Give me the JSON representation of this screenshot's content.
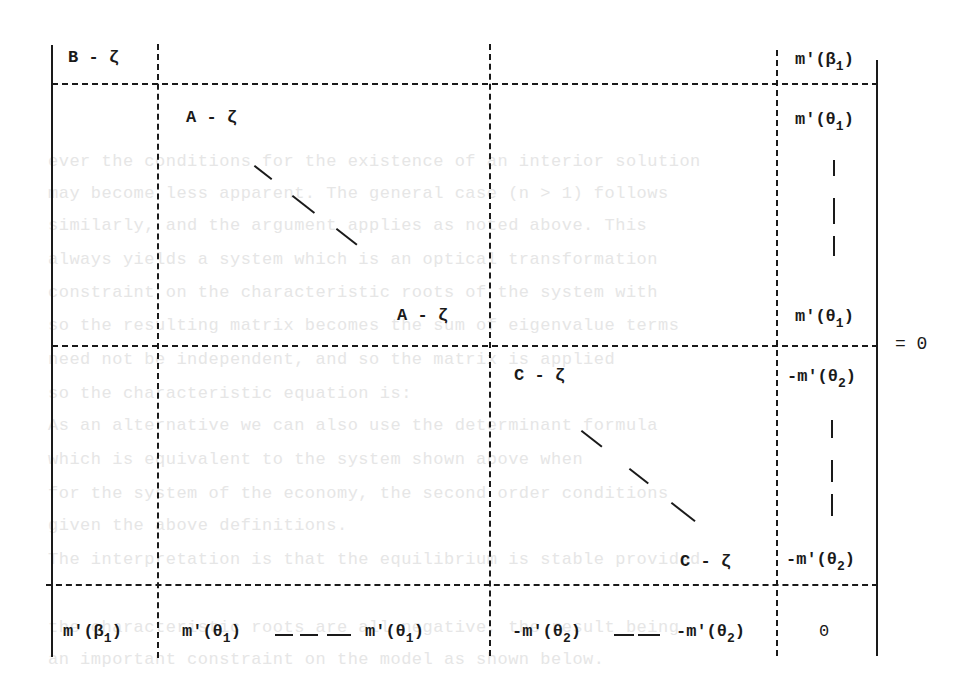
{
  "equation": {
    "type": "block-matrix-determinant",
    "rhs": "= 0",
    "blocks": {
      "row1": {
        "col1": "B - ζ",
        "col4": "m'(β",
        "col4_sub": "1",
        "col4_close": ")"
      },
      "row2": {
        "diag_top": "A - ζ",
        "diag_bottom": "A - ζ",
        "col4_top": "m'(θ",
        "col4_top_sub": "1",
        "col4_top_close": ")",
        "col4_bottom": "m'(θ",
        "col4_bottom_sub": "1",
        "col4_bottom_close": ")"
      },
      "row3": {
        "diag_top": "C - ζ",
        "diag_bottom": "C - ζ",
        "col4_top": "-m'(θ",
        "col4_top_sub": "2",
        "col4_top_close": ")",
        "col4_bottom": "-m'(θ",
        "col4_bottom_sub": "2",
        "col4_bottom_close": ")"
      },
      "row4": {
        "col1": "m'(β",
        "col1_sub": "1",
        "col1_close": ")",
        "col2_left": "m'(θ",
        "col2_left_sub": "1",
        "col2_left_close": ")",
        "col2_right": "m'(θ",
        "col2_right_sub": "1",
        "col2_right_close": ")",
        "col3_left": "-m'(θ",
        "col3_left_sub": "2",
        "col3_left_close": ")",
        "col3_right": "-m'(θ",
        "col3_right_sub": "2",
        "col3_right_close": ")",
        "col4": "0"
      }
    }
  },
  "background_text": [
    "ever the conditions for the existence of an interior solution",
    "may become less apparent. The general case (n > 1) follows",
    "similarly, and the argument applies as noted above. This",
    "always yields a system which is an optical transformation",
    "constraint on the characteristic roots of the system with",
    "so the resulting matrix becomes the sum of eigenvalue terms",
    "need not be independent, and so the matrix is applied",
    "so the characteristic equation is:",
    "As an alternative we can also use the determinant formula",
    "which is equivalent to the system shown above when",
    "for the system of the economy, the second order conditions",
    "given the above definitions.",
    "The interpretation is that the equilibrium is stable provided",
    "the characteristic roots are all negative, the result being",
    "an important constraint on the model as shown below."
  ]
}
